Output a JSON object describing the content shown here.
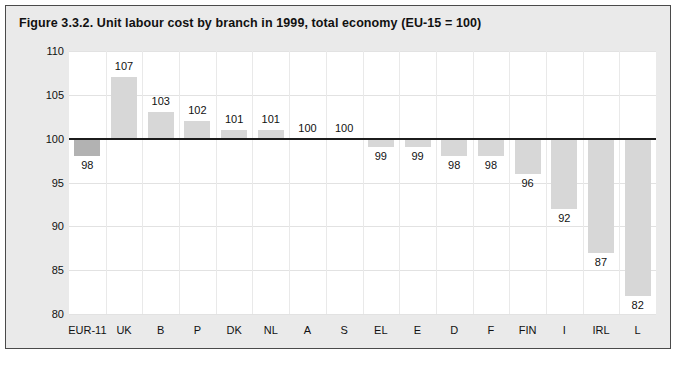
{
  "figure": {
    "title": "Figure 3.3.2. Unit labour cost by branch in 1999, total economy (EU-15 = 100)"
  },
  "colors": {
    "bar": "#d7d7d7",
    "bar_highlight": "#b2b2b2",
    "baseline": "#1c1c1c",
    "panel_background": "#eaeaea",
    "plot_background": "#ffffff",
    "gridline": "#e2e2e2",
    "border": "#4a4a4a",
    "text": "#111111"
  },
  "chart_data": {
    "type": "bar",
    "title": "Figure 3.3.2. Unit labour cost by branch in 1999, total economy (EU-15 = 100)",
    "xlabel": "",
    "ylabel": "",
    "ylim": [
      80,
      110
    ],
    "yticks": [
      80,
      85,
      90,
      95,
      100,
      105,
      110
    ],
    "ytick_labels": [
      "80",
      "85",
      "90",
      "95",
      "100",
      "105",
      "110"
    ],
    "baseline": 100,
    "grid": true,
    "legend": "none",
    "orientation": "vertical",
    "categories": [
      "EUR-11",
      "UK",
      "B",
      "P",
      "DK",
      "NL",
      "A",
      "S",
      "EL",
      "E",
      "D",
      "F",
      "FIN",
      "I",
      "IRL",
      "L"
    ],
    "values": [
      98,
      107,
      103,
      102,
      101,
      101,
      100,
      100,
      99,
      99,
      98,
      98,
      96,
      92,
      87,
      82
    ],
    "data_labels": [
      "98",
      "107",
      "103",
      "102",
      "101",
      "101",
      "100",
      "100",
      "99",
      "99",
      "98",
      "98",
      "96",
      "92",
      "87",
      "82"
    ],
    "highlight_index": 0
  }
}
